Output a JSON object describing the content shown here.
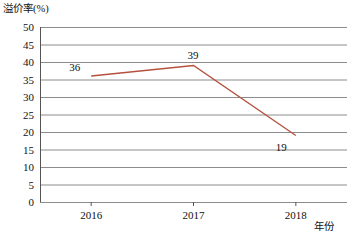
{
  "chart_data": {
    "type": "line",
    "title": "",
    "ylabel": "溢价率(%)",
    "xlabel": "年份",
    "categories": [
      "2016",
      "2017",
      "2018"
    ],
    "values": [
      36,
      39,
      19
    ],
    "series": [
      {
        "name": "溢价率",
        "values": [
          36,
          39,
          19
        ]
      }
    ],
    "point_labels": [
      "36",
      "39",
      "19"
    ],
    "ylim": [
      0,
      50
    ],
    "y_ticks": [
      "50",
      "45",
      "40",
      "35",
      "30",
      "25",
      "20",
      "15",
      "10",
      "5",
      "0"
    ],
    "y_tick_step": 5,
    "grid": true,
    "legend": "none",
    "line_color": "#b4503c",
    "grid_color": "#8c8c8c",
    "axis_color": "#555555"
  }
}
